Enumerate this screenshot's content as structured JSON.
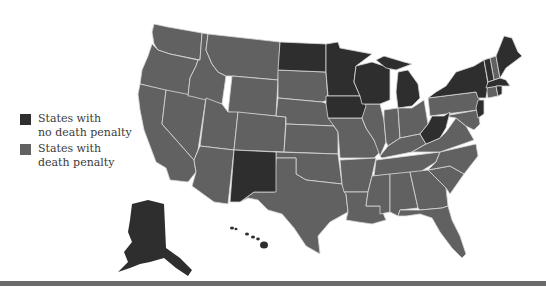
{
  "legend": [
    {
      "label_line1": "States with",
      "label_line2": "no death penalty",
      "color": "#2e2e2e"
    },
    {
      "label_line1": "States with",
      "label_line2": "death penalty",
      "color": "#616161"
    }
  ],
  "colors": {
    "no_death_penalty": "#2e2e2e",
    "death_penalty": "#616161",
    "borders": "#d8d8d8",
    "background": "#ffffff",
    "bottom_rule": "#6a6a6a"
  },
  "states_no_death_penalty": [
    "Alaska",
    "Hawaii",
    "New Mexico",
    "North Dakota",
    "Minnesota",
    "Iowa",
    "Wisconsin",
    "Michigan",
    "West Virginia",
    "Massachusetts",
    "Vermont",
    "Maine",
    "New York",
    "New Jersey",
    "Rhode Island"
  ],
  "states_death_penalty": [
    "Washington",
    "Oregon",
    "California",
    "Nevada",
    "Idaho",
    "Montana",
    "Wyoming",
    "Utah",
    "Arizona",
    "Colorado",
    "South Dakota",
    "Nebraska",
    "Kansas",
    "Oklahoma",
    "Texas",
    "Missouri",
    "Arkansas",
    "Louisiana",
    "Illinois",
    "Indiana",
    "Ohio",
    "Kentucky",
    "Tennessee",
    "Mississippi",
    "Alabama",
    "Georgia",
    "Florida",
    "South Carolina",
    "North Carolina",
    "Virginia",
    "Pennsylvania",
    "Maryland",
    "Delaware",
    "New Hampshire",
    "Connecticut"
  ]
}
